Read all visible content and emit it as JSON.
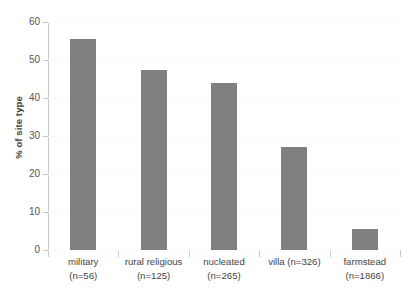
{
  "chart_data": {
    "type": "bar",
    "title": "",
    "xlabel": "",
    "ylabel": "% of site type",
    "categories": [
      "military (n=56)",
      "rural religious (n=125)",
      "nucleated (n=265)",
      "villa (n=326)",
      "farmstead (n=1866)"
    ],
    "category_lines": [
      {
        "line1": "military",
        "line2": "(n=56)"
      },
      {
        "line1": "rural religious",
        "line2": "(n=125)"
      },
      {
        "line1": "nucleated",
        "line2": "(n=265)"
      },
      {
        "line1": "villa (n=326)",
        "line2": ""
      },
      {
        "line1": "farmstead",
        "line2": "(n=1866)"
      }
    ],
    "values": [
      55.5,
      47.5,
      44.0,
      27.0,
      5.5
    ],
    "ylim": [
      0,
      60
    ],
    "yticks": [
      0,
      10,
      20,
      30,
      40,
      50,
      60
    ],
    "ytick_labels": [
      "0",
      "10",
      "20",
      "30",
      "40",
      "50",
      "60"
    ],
    "grid": true,
    "legend": false,
    "bar_color": "#808080",
    "axis_color": "#c8c8c8",
    "grid_color": "#fbfbfb",
    "text_color": "#444444",
    "background": "#ffffff"
  }
}
